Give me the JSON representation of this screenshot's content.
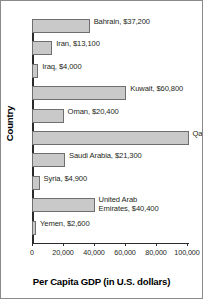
{
  "chart_data": {
    "type": "bar",
    "orientation": "horizontal",
    "title": "",
    "xlabel": "Per Capita GDP (in U.S. dollars)",
    "ylabel": "Country",
    "xlim": [
      0,
      100000
    ],
    "grid": false,
    "legend": "none",
    "xticks": [
      {
        "value": 0,
        "label": "0"
      },
      {
        "value": 20000,
        "label": "20,000"
      },
      {
        "value": 40000,
        "label": "40,000"
      },
      {
        "value": 60000,
        "label": "60,000"
      },
      {
        "value": 80000,
        "label": "80,000"
      },
      {
        "value": 100000,
        "label": "100,000"
      }
    ],
    "bar_color": "#c9c9c9",
    "bar_edge_color": "#6f6f6f",
    "categories": [
      "Bahrain",
      "Iran",
      "Iraq",
      "Kuwait",
      "Oman",
      "Qatar",
      "Saudi Arabia",
      "Syria",
      "United Arab Emirates",
      "Yemen"
    ],
    "values": [
      37200,
      13100,
      4000,
      60800,
      20400,
      101000,
      21300,
      4900,
      40400,
      2600
    ],
    "bars": [
      {
        "category": "Bahrain",
        "value": 37200,
        "label": "Bahrain, $37,200",
        "wrap": false
      },
      {
        "category": "Iran",
        "value": 13100,
        "label": "Iran, $13,100",
        "wrap": false
      },
      {
        "category": "Iraq",
        "value": 4000,
        "label": "Iraq, $4,000",
        "wrap": false
      },
      {
        "category": "Kuwait",
        "value": 60800,
        "label": "Kuwait, $60,800",
        "wrap": false
      },
      {
        "category": "Oman",
        "value": 20400,
        "label": "Oman, $20,400",
        "wrap": false
      },
      {
        "category": "Qatar",
        "value": 101000,
        "label": "Qatar, $101,000",
        "wrap": false
      },
      {
        "category": "Saudi Arabia",
        "value": 21300,
        "label": "Saudi Arabia, $21,300",
        "wrap": false
      },
      {
        "category": "Syria",
        "value": 4900,
        "label": "Syria, $4,900",
        "wrap": false
      },
      {
        "category": "United Arab Emirates",
        "value": 40400,
        "label": "United Arab Emirates, $40,400",
        "wrap": true
      },
      {
        "category": "Yemen",
        "value": 2600,
        "label": "Yemen, $2,600",
        "wrap": false
      }
    ]
  }
}
